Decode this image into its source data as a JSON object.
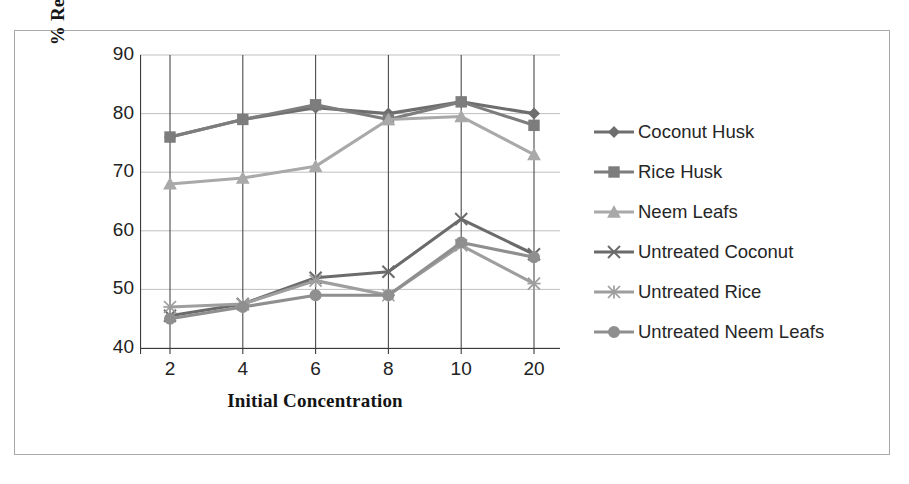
{
  "chart_data": {
    "type": "line",
    "title": "",
    "xlabel": "Initial Concentration",
    "ylabel": "% Removal of Chromium",
    "categories": [
      "2",
      "4",
      "6",
      "8",
      "10",
      "20"
    ],
    "ylim": [
      40,
      90
    ],
    "yticks": [
      40,
      50,
      60,
      70,
      80,
      90
    ],
    "grid": true,
    "legend_position": "right",
    "series": [
      {
        "name": "Coconut Husk",
        "marker": "diamond",
        "color": "#6e6e6e",
        "values": [
          76,
          79,
          81,
          80,
          82,
          80
        ]
      },
      {
        "name": "Rice Husk",
        "marker": "square",
        "color": "#7d7d7d",
        "values": [
          76,
          79,
          81.5,
          79,
          82,
          78
        ]
      },
      {
        "name": "Neem Leafs",
        "marker": "triangle",
        "color": "#a9a9a9",
        "values": [
          68,
          69,
          71,
          79,
          79.5,
          73
        ]
      },
      {
        "name": "Untreated Coconut",
        "marker": "x-cross",
        "color": "#6b6b6b",
        "values": [
          45.5,
          47.5,
          52,
          53,
          62,
          56
        ]
      },
      {
        "name": "Untreated Rice",
        "marker": "asterisk",
        "color": "#9e9e9e",
        "values": [
          47,
          47.5,
          51.5,
          49,
          57.5,
          51
        ]
      },
      {
        "name": "Untreated Neem Leafs",
        "marker": "circle",
        "color": "#8f8f8f",
        "values": [
          45,
          47,
          49,
          49,
          58,
          55.5
        ]
      }
    ]
  },
  "axes": {
    "y_tick_labels": [
      "90",
      "80",
      "70",
      "60",
      "50",
      "40"
    ],
    "x_tick_labels": [
      "2",
      "4",
      "6",
      "8",
      "10",
      "20"
    ],
    "y_title": "% Removal of Chromium",
    "x_title": "Initial Concentration"
  },
  "legend": {
    "items": [
      {
        "label": "Coconut Husk"
      },
      {
        "label": "Rice Husk"
      },
      {
        "label": "Neem Leafs"
      },
      {
        "label": "Untreated Coconut"
      },
      {
        "label": "Untreated Rice"
      },
      {
        "label": "Untreated Neem Leafs"
      }
    ]
  },
  "colors": {
    "axis": "#3a3a3a",
    "grid": "#b8b8b8",
    "frame": "#a8a8a8",
    "text": "#222222"
  }
}
